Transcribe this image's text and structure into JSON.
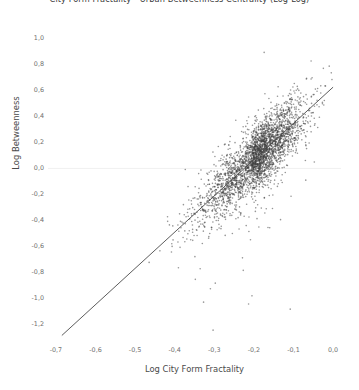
{
  "chart_data": {
    "type": "scatter",
    "title": "City Form Fractality - Urban Betweenness Centrality (Log-Log)",
    "xlabel": "Log City Form Fractality",
    "ylabel": "Log Betweenness",
    "xlim": [
      -0.72,
      0.02
    ],
    "ylim": [
      -1.32,
      1.08
    ],
    "xticks": [
      -0.7,
      -0.6,
      -0.5,
      -0.4,
      -0.3,
      -0.2,
      -0.1,
      0.0
    ],
    "xticklabels": [
      "-0,7",
      "-0,6",
      "-0,5",
      "-0,4",
      "-0,3",
      "-0,2",
      "-0,1",
      "0,0"
    ],
    "yticks": [
      1.0,
      0.8,
      0.6,
      0.4,
      0.2,
      0.0,
      -0.2,
      -0.4,
      -0.6,
      -0.8,
      -1.0,
      -1.2
    ],
    "yticklabels": [
      "1,0",
      "0,8",
      "0,6",
      "0,4",
      "0,2",
      "0,0",
      "-0,2",
      "-0,4",
      "-0,6",
      "-0,8",
      "-1,0",
      "-1,2"
    ],
    "decimal_separator": ",",
    "grid": "horizontal-zero-line-only",
    "legend": "none",
    "n_points": 3000,
    "point_color": "#3f3f3f",
    "point_opacity": 0.55,
    "point_size": 1.6,
    "marker": "circle",
    "trendline": {
      "type": "linear-regression",
      "color": "#4a4a4a",
      "width": 0.9,
      "x_start": -0.685,
      "y_start": -1.285,
      "x_end": 0.0,
      "y_end": 0.625,
      "slope": 2.788,
      "intercept": 0.625
    },
    "distribution": {
      "description": "Dense positively-correlated diagonal band; point density increases strongly toward the upper-right (x near -0.1, y near 0.2). Sparse scattered outliers below and to the left of the main band.",
      "x_mean": -0.205,
      "y_mean": 0.055,
      "x_sd": 0.072,
      "y_sd": 0.235,
      "correlation": 0.86,
      "residual_sd": 0.12,
      "outlier_fraction": 0.035
    }
  }
}
